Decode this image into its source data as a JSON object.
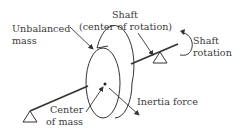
{
  "diagram": {
    "labels": {
      "unbalanced_mass_line1": "Unbalanced",
      "unbalanced_mass_line2": "mass",
      "shaft_line1": "Shaft",
      "shaft_line2": "(center of rotation)",
      "shaft_rotation_line1": "Shaft",
      "shaft_rotation_line2": "rotation",
      "center_of_mass_line1": "Center",
      "center_of_mass_line2": "of mass",
      "inertia_force": "Inertia force"
    },
    "colors": {
      "stroke": "#333333",
      "text": "#3a3a3a",
      "background": "#ffffff"
    }
  }
}
